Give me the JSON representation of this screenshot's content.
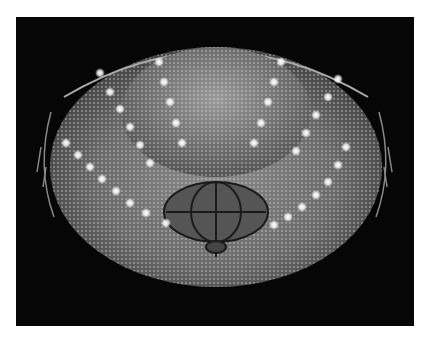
{
  "image": {
    "subject": "crystal chandelier",
    "colors": {
      "background": "#ffffff",
      "photo_background": "#060606",
      "crystal": "#bdbdbd",
      "bulb": "#ffffff"
    }
  }
}
